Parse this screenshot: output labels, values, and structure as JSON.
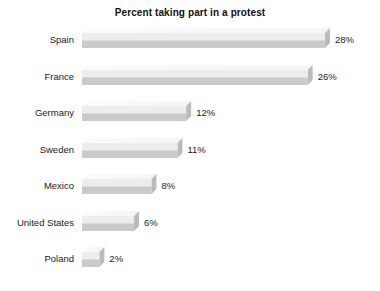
{
  "chart_data": {
    "type": "bar",
    "orientation": "horizontal",
    "title": "Percent taking part in a protest",
    "xlabel": "",
    "ylabel": "",
    "xlim": [
      0,
      29.5
    ],
    "grid": false,
    "legend": false,
    "value_suffix": "%",
    "categories": [
      "Spain",
      "France",
      "Germany",
      "Sweden",
      "Mexico",
      "United States",
      "Poland"
    ],
    "values": [
      28,
      26,
      12,
      11,
      8,
      6,
      2
    ],
    "value_labels": [
      "28%",
      "26%",
      "12%",
      "11%",
      "8%",
      "6%",
      "2%"
    ],
    "colors": {
      "bar_front_top": "#eceded",
      "bar_front_bottom": "#c9cbcb",
      "bar_top_face": "#f4f5f5",
      "bar_side_face": "#b9bcbc",
      "background": "#ffffff",
      "text": "#1a1a1a",
      "title": "#111111"
    }
  },
  "rows": [
    {
      "label": "Spain",
      "value_label": "28%",
      "value": 28
    },
    {
      "label": "France",
      "value_label": "26%",
      "value": 26
    },
    {
      "label": "Germany",
      "value_label": "12%",
      "value": 12
    },
    {
      "label": "Sweden",
      "value_label": "11%",
      "value": 11
    },
    {
      "label": "Mexico",
      "value_label": "8%",
      "value": 8
    },
    {
      "label": "United States",
      "value_label": "6%",
      "value": 6
    },
    {
      "label": "Poland",
      "value_label": "2%",
      "value": 2
    }
  ]
}
